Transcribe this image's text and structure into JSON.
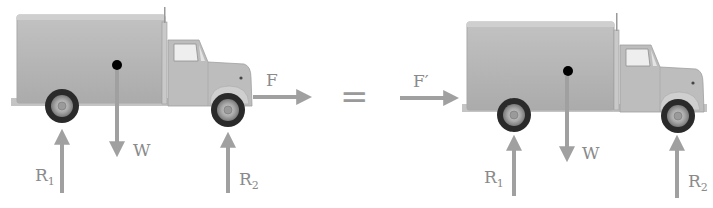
{
  "figure": {
    "equals_symbol": "=",
    "colors": {
      "truck_body": "#b9b9b9",
      "truck_shadow": "#a3a3a3",
      "arrow": "#a0a0a0",
      "label": "#8a8a8a",
      "tire": "#2a2a2a",
      "cg_dot": "#000000"
    }
  },
  "left_truck": {
    "force_label": "F",
    "weight_label": "W",
    "reaction_rear": {
      "main": "R",
      "sub": "1"
    },
    "reaction_front": {
      "main": "R",
      "sub": "2"
    }
  },
  "right_truck": {
    "force_label": "F′",
    "weight_label": "W",
    "reaction_rear": {
      "main": "R",
      "sub": "1"
    },
    "reaction_front": {
      "main": "R",
      "sub": "2"
    }
  }
}
